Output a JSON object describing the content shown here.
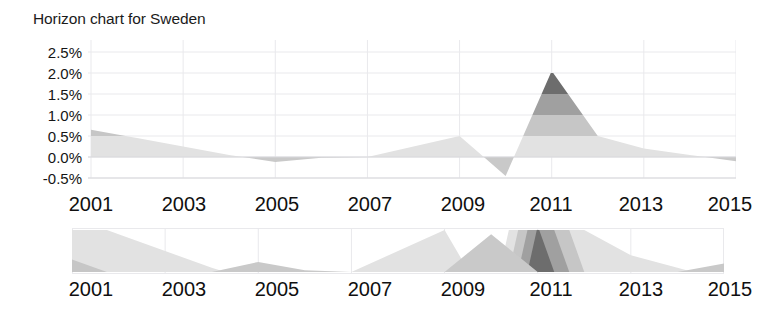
{
  "title": "Horizon chart for Sweden",
  "axes": {
    "y_ticks": [
      "2.5%",
      "2.0%",
      "1.5%",
      "1.0%",
      "0.5%",
      "0.0%",
      "-0.5%"
    ],
    "x_ticks": [
      "2001",
      "2003",
      "2005",
      "2007",
      "2009",
      "2011",
      "2013",
      "2015"
    ]
  },
  "colors": {
    "band_1": "#e2e2e2",
    "band_2": "#c6c6c6",
    "band_3": "#a0a0a0",
    "band_4": "#6d6d6d",
    "negative": "#c9c9c9",
    "grid": "#e9e9ec",
    "axis_line": "#d8d8dc",
    "text": "#151515"
  },
  "chart_data": {
    "type": "area",
    "title": "Horizon chart for Sweden",
    "xlabel": "",
    "ylabel": "",
    "grid": true,
    "legend": "none",
    "xlim": [
      2001,
      2015
    ],
    "ylim": [
      -0.5,
      2.5
    ],
    "band_size": 0.5,
    "y_tick_values": [
      2.5,
      2.0,
      1.5,
      1.0,
      0.5,
      0.0,
      -0.5
    ],
    "x_tick_values": [
      2001,
      2003,
      2005,
      2007,
      2009,
      2011,
      2013,
      2015
    ],
    "x": [
      2001,
      2002,
      2003,
      2004,
      2005,
      2006,
      2007,
      2008,
      2009,
      2010,
      2011,
      2012,
      2013,
      2014,
      2015
    ],
    "values": [
      0.65,
      0.45,
      0.25,
      0.05,
      -0.12,
      -0.02,
      0.0,
      0.25,
      0.5,
      -0.45,
      2.05,
      0.5,
      0.2,
      0.05,
      -0.1
    ],
    "series": [
      {
        "name": "Sweden",
        "values": [
          0.65,
          0.45,
          0.25,
          0.05,
          -0.12,
          -0.02,
          0.0,
          0.25,
          0.5,
          -0.45,
          2.05,
          0.5,
          0.2,
          0.05,
          -0.1
        ]
      }
    ],
    "panels": [
      {
        "name": "expanded-horizon",
        "bands": 4,
        "band_size": 0.5,
        "ylim": [
          -0.5,
          2.5
        ]
      },
      {
        "name": "collapsed-horizon",
        "bands": 4,
        "band_size": 0.5,
        "ylim": [
          -0.5,
          0.5
        ]
      }
    ]
  }
}
